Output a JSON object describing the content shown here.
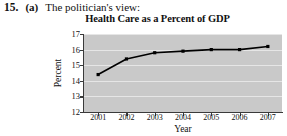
{
  "header": {
    "problem_number": "15.",
    "problem_letter": "(a)",
    "prompt": "The politician's view:"
  },
  "chart_data": {
    "type": "line",
    "title": "Health Care as a Percent of GDP",
    "xlabel": "Year",
    "ylabel": "Percent",
    "categories": [
      "2001",
      "2002",
      "2003",
      "2004",
      "2005",
      "2006",
      "2007"
    ],
    "values": [
      14.4,
      15.4,
      15.8,
      15.9,
      16.0,
      16.0,
      16.2
    ],
    "ylim": [
      12,
      17
    ],
    "yticks": [
      "12",
      "13",
      "14",
      "15",
      "16",
      "17"
    ],
    "grid": true,
    "legend": "none",
    "marker": "square",
    "plot_background": "#c9c9c9",
    "line_color": "#000000",
    "grid_color": "#e6e6e6",
    "axis_color": "#3a3a3a"
  }
}
